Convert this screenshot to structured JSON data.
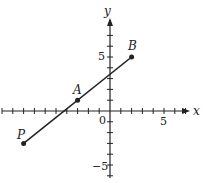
{
  "chart_data": {
    "type": "line",
    "title": "",
    "xlabel": "x",
    "ylabel": "y",
    "xlim": [
      -10,
      7
    ],
    "ylim": [
      -6,
      8
    ],
    "x_tick_labels": [
      "0",
      "5"
    ],
    "y_tick_labels": [
      "5",
      "-5"
    ],
    "points": [
      {
        "label": "P",
        "x": -8,
        "y": -3
      },
      {
        "label": "A",
        "x": -3,
        "y": 1
      },
      {
        "label": "B",
        "x": 2,
        "y": 5
      }
    ],
    "series": [
      {
        "name": "segment PB",
        "x": [
          -8,
          2
        ],
        "y": [
          -3,
          5
        ]
      }
    ],
    "grid": false,
    "legend": null
  },
  "labels": {
    "x_axis": "x",
    "y_axis": "y",
    "origin": "0",
    "x_five": "5",
    "y_five": "5",
    "y_neg_five": "−5",
    "P": "P",
    "A": "A",
    "B": "B"
  }
}
